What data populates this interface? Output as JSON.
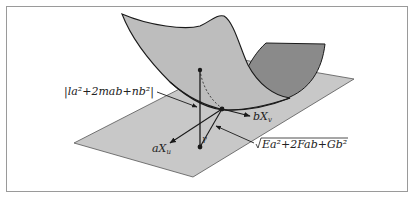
{
  "figure": {
    "colors": {
      "frame": "#9a9a9a",
      "plane_fill": "#c8c8c8",
      "plane_stroke": "#555555",
      "surface_front": "#bdbdbd",
      "surface_back": "#8a8a8a",
      "outline": "#1a1a1a"
    }
  },
  "labels": {
    "second_fundamental": "|la²+2mab+nb²|",
    "vector_a": "aX",
    "vector_a_sub": "u",
    "vector_b": "bX",
    "vector_b_sub": "v",
    "first_fundamental": "Ea²+2Fab+Gb²",
    "angle_marker": "γ"
  }
}
